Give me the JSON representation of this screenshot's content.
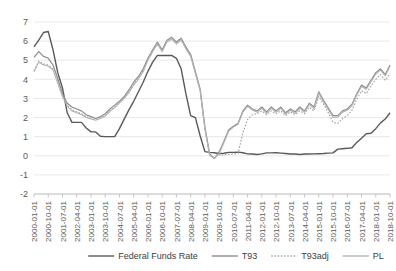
{
  "chart_data": {
    "type": "line",
    "title": "",
    "xlabel": "",
    "ylabel": "",
    "ylim": [
      -2,
      7
    ],
    "yticks": [
      -2,
      -1,
      0,
      1,
      2,
      3,
      4,
      5,
      6,
      7
    ],
    "grid": true,
    "legend_position": "bottom",
    "xtick_labels": [
      "2000-01-01",
      "2000-10-01",
      "2001-07-01",
      "2002-04-01",
      "2003-01-01",
      "2003-10-01",
      "2004-07-01",
      "2005-04-01",
      "2006-01-01",
      "2006-10-01",
      "2007-07-01",
      "2008-04-01",
      "2009-01-01",
      "2009-10-01",
      "2010-07-01",
      "2011-04-01",
      "2012-01-01",
      "2012-10-01",
      "2013-07-01",
      "2014-04-01",
      "2015-01-01",
      "2015-10-01",
      "2016-07-01",
      "2017-04-01",
      "2018-01-01",
      "2018-10-01"
    ],
    "x": [
      "2000-01-01",
      "2000-04-01",
      "2000-07-01",
      "2000-10-01",
      "2001-01-01",
      "2001-04-01",
      "2001-07-01",
      "2001-10-01",
      "2002-01-01",
      "2002-04-01",
      "2002-07-01",
      "2002-10-01",
      "2003-01-01",
      "2003-04-01",
      "2003-07-01",
      "2003-10-01",
      "2004-01-01",
      "2004-04-01",
      "2004-07-01",
      "2004-10-01",
      "2005-01-01",
      "2005-04-01",
      "2005-07-01",
      "2005-10-01",
      "2006-01-01",
      "2006-04-01",
      "2006-07-01",
      "2006-10-01",
      "2007-01-01",
      "2007-04-01",
      "2007-07-01",
      "2007-10-01",
      "2008-01-01",
      "2008-04-01",
      "2008-07-01",
      "2008-10-01",
      "2009-01-01",
      "2009-04-01",
      "2009-07-01",
      "2009-10-01",
      "2010-01-01",
      "2010-04-01",
      "2010-07-01",
      "2010-10-01",
      "2011-01-01",
      "2011-04-01",
      "2011-07-01",
      "2011-10-01",
      "2012-01-01",
      "2012-04-01",
      "2012-07-01",
      "2012-10-01",
      "2013-01-01",
      "2013-04-01",
      "2013-07-01",
      "2013-10-01",
      "2014-01-01",
      "2014-04-01",
      "2014-07-01",
      "2014-10-01",
      "2015-01-01",
      "2015-04-01",
      "2015-07-01",
      "2015-10-01",
      "2016-01-01",
      "2016-04-01",
      "2016-07-01",
      "2016-10-01",
      "2017-01-01",
      "2017-04-01",
      "2017-07-01",
      "2017-10-01",
      "2018-01-01",
      "2018-04-01",
      "2018-07-01",
      "2018-10-01"
    ],
    "series": [
      {
        "name": "Federal Funds Rate",
        "color": "#595959",
        "style": "solid",
        "width": 1.4,
        "values": [
          5.7,
          6.05,
          6.45,
          6.5,
          5.55,
          4.35,
          3.55,
          2.25,
          1.75,
          1.75,
          1.75,
          1.45,
          1.25,
          1.25,
          1.02,
          1.0,
          1.0,
          1.0,
          1.42,
          1.92,
          2.4,
          2.85,
          3.35,
          3.85,
          4.42,
          4.9,
          5.25,
          5.25,
          5.25,
          5.25,
          5.1,
          4.55,
          3.25,
          2.1,
          2.0,
          1.05,
          0.22,
          0.18,
          0.16,
          0.12,
          0.13,
          0.18,
          0.18,
          0.19,
          0.16,
          0.1,
          0.09,
          0.07,
          0.1,
          0.15,
          0.15,
          0.16,
          0.14,
          0.12,
          0.09,
          0.09,
          0.07,
          0.09,
          0.09,
          0.1,
          0.11,
          0.12,
          0.14,
          0.15,
          0.35,
          0.37,
          0.39,
          0.42,
          0.7,
          0.92,
          1.15,
          1.18,
          1.42,
          1.72,
          1.92,
          2.25
        ]
      },
      {
        "name": "T93",
        "color": "#8c8c8c",
        "style": "solid",
        "width": 1.2,
        "values": [
          5.15,
          5.45,
          5.2,
          5.1,
          4.75,
          4.05,
          3.25,
          2.75,
          2.55,
          2.45,
          2.35,
          2.15,
          2.05,
          1.95,
          2.05,
          2.2,
          2.45,
          2.65,
          2.85,
          3.1,
          3.45,
          3.85,
          4.15,
          4.55,
          5.1,
          5.55,
          5.95,
          5.55,
          6.05,
          6.2,
          5.95,
          6.15,
          5.7,
          5.3,
          4.4,
          3.5,
          1.5,
          0.1,
          -0.15,
          0.2,
          0.75,
          1.35,
          1.55,
          1.7,
          2.35,
          2.65,
          2.45,
          2.35,
          2.55,
          2.3,
          2.55,
          2.35,
          2.55,
          2.25,
          2.45,
          2.3,
          2.55,
          2.35,
          2.75,
          2.55,
          3.35,
          2.9,
          2.5,
          2.1,
          2.1,
          2.35,
          2.45,
          2.7,
          3.25,
          3.7,
          3.55,
          3.95,
          4.35,
          4.55,
          4.25,
          4.75
        ]
      },
      {
        "name": "T93adj",
        "color": "#a6a6a6",
        "style": "dotted",
        "width": 1.2,
        "values": [
          4.45,
          4.95,
          4.8,
          4.75,
          4.55,
          3.85,
          3.15,
          2.65,
          2.4,
          2.3,
          2.2,
          2.05,
          1.95,
          1.9,
          1.98,
          2.1,
          2.35,
          2.55,
          2.8,
          3.05,
          3.35,
          3.75,
          4.05,
          4.45,
          5.05,
          5.5,
          5.9,
          5.5,
          6.0,
          6.15,
          5.9,
          6.1,
          5.65,
          5.25,
          4.35,
          3.45,
          1.45,
          0.05,
          -0.1,
          0.05,
          0.05,
          0.08,
          0.1,
          0.12,
          1.2,
          1.9,
          2.15,
          2.2,
          2.35,
          2.15,
          2.35,
          2.2,
          2.35,
          2.1,
          2.3,
          2.15,
          2.35,
          2.2,
          2.55,
          2.35,
          3.1,
          2.7,
          2.25,
          1.75,
          1.7,
          1.95,
          2.1,
          2.4,
          2.95,
          3.4,
          3.25,
          3.65,
          4.0,
          4.25,
          3.95,
          4.3
        ]
      },
      {
        "name": "PL",
        "color": "#b3b3b3",
        "style": "solid",
        "width": 1.1,
        "values": [
          4.4,
          4.9,
          4.75,
          4.7,
          4.5,
          3.8,
          3.1,
          2.6,
          2.35,
          2.25,
          2.15,
          2.0,
          1.92,
          1.86,
          1.95,
          2.08,
          2.32,
          2.52,
          2.76,
          3.0,
          3.3,
          3.7,
          4.0,
          4.4,
          5.0,
          5.45,
          5.85,
          5.45,
          5.95,
          6.1,
          5.85,
          6.05,
          5.6,
          5.2,
          4.3,
          3.4,
          1.4,
          0.02,
          -0.14,
          0.12,
          0.68,
          1.28,
          1.5,
          1.65,
          2.28,
          2.58,
          2.4,
          2.28,
          2.48,
          2.22,
          2.48,
          2.28,
          2.48,
          2.18,
          2.38,
          2.22,
          2.48,
          2.28,
          2.68,
          2.48,
          3.28,
          2.82,
          2.42,
          2.0,
          2.02,
          2.28,
          2.38,
          2.62,
          3.18,
          3.62,
          3.48,
          3.88,
          4.28,
          4.48,
          4.18,
          4.68
        ]
      }
    ],
    "legend": [
      {
        "label": "Federal Funds Rate",
        "color": "#595959",
        "style": "solid"
      },
      {
        "label": "T93",
        "color": "#8c8c8c",
        "style": "solid"
      },
      {
        "label": "T93adj",
        "color": "#a6a6a6",
        "style": "dotted"
      },
      {
        "label": "PL",
        "color": "#b3b3b3",
        "style": "solid"
      }
    ],
    "colors": {
      "gridline": "#e2e2e2",
      "axis": "#bfbfbf",
      "tick_text": "#595959",
      "background": "#ffffff"
    }
  }
}
